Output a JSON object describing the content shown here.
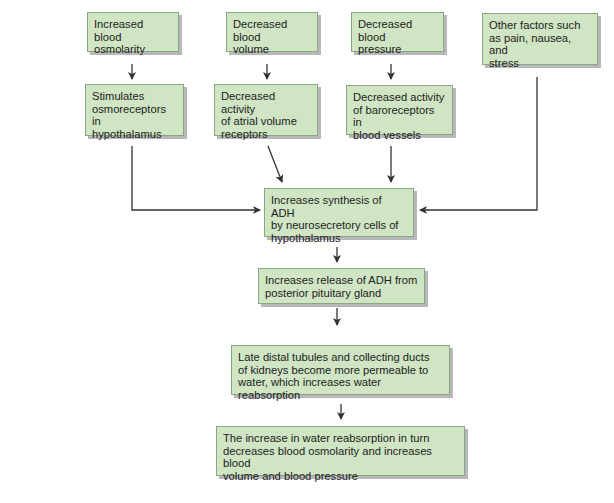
{
  "diagram": {
    "colors": {
      "box_fill": "#cfe5c4",
      "box_border": "#8aa880",
      "box_shadow": "#b8b8bc",
      "arrow": "#333333",
      "text": "#222222"
    },
    "inputs": [
      {
        "id": "osmolarity",
        "label": "Increased blood\nosmolarity"
      },
      {
        "id": "volume",
        "label": "Decreased blood\nvolume"
      },
      {
        "id": "pressure",
        "label": "Decreased blood\npressure"
      },
      {
        "id": "other",
        "label": "Other factors such\nas pain, nausea, and\nstress"
      }
    ],
    "receptors": [
      {
        "id": "osmoreceptors",
        "label": "Stimulates\nosmoreceptors in\nhypothalamus"
      },
      {
        "id": "atrial",
        "label": "Decreased activity\nof atrial volume\nreceptors"
      },
      {
        "id": "baroreceptors",
        "label": "Decreased activity\nof baroreceptors in\nblood vessels"
      }
    ],
    "chain": [
      {
        "id": "synthesis",
        "label": "Increases synthesis of ADH\nby neurosecretory cells of\nhypothalamus"
      },
      {
        "id": "release",
        "label": "Increases release of ADH from\nposterior pituitary gland"
      },
      {
        "id": "kidneys",
        "label": "Late distal tubules and collecting ducts\nof kidneys become more permeable to\nwater, which increases water reabsorption"
      },
      {
        "id": "outcome",
        "label": "The increase in water reabsorption in turn\ndecreases blood osmolarity and increases blood\nvolume and blood pressure"
      }
    ]
  }
}
